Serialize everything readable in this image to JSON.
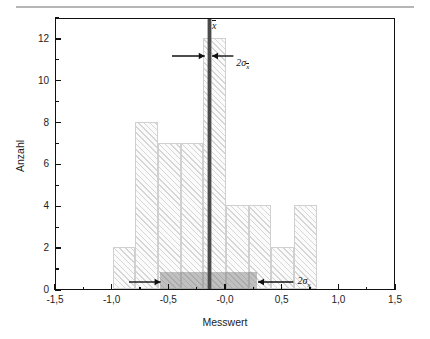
{
  "figure": {
    "top_rule": true,
    "background": "#ffffff",
    "frame_color": "#111111"
  },
  "chart_data": {
    "type": "bar",
    "title": "",
    "subtitle": "",
    "xlabel": "Messwert",
    "ylabel": "Anzahl",
    "xlim": [
      -1.5,
      1.5
    ],
    "ylim": [
      0,
      13
    ],
    "grid": false,
    "legend": null,
    "bar_color": "#fbfbfb",
    "bar_edge_color": "#d0d0d0",
    "hatch": "diagonal-45",
    "bin_width": 0.2,
    "bin_edges": [
      -1.0,
      -0.8,
      -0.6,
      -0.4,
      -0.2,
      0.0,
      0.2,
      0.4,
      0.6,
      0.8
    ],
    "categories": [
      "-1,0 bis -0,8",
      "-0,8 bis -0,6",
      "-0,6 bis -0,4",
      "-0,4 bis -0,2",
      "-0,2 bis -0,0",
      "-0,0 bis 0,2",
      "0,2 bis 0,4",
      "0,4 bis 0,6",
      "0,6 bis 0,8"
    ],
    "values": [
      2,
      8,
      7,
      7,
      12,
      4,
      4,
      2,
      4
    ],
    "xticks": [
      -1.5,
      -1.0,
      -0.5,
      -0.0,
      0.5,
      1.0,
      1.5
    ],
    "xticklabels": [
      "-1,5",
      "-1,0",
      "-0,5",
      "-0,0",
      "0,5",
      "1,0",
      "1,5"
    ],
    "xminor_ticks": [
      -1.25,
      -0.75,
      -0.25,
      0.25,
      0.75,
      1.25
    ],
    "yticks": [
      0,
      2,
      4,
      6,
      8,
      10,
      12
    ],
    "yticklabels": [
      "0",
      "2",
      "4",
      "6",
      "8",
      "10",
      "12"
    ],
    "yminor_ticks": [
      1,
      3,
      5,
      7,
      9,
      11,
      13
    ],
    "annotations": {
      "mean": {
        "label": "x",
        "overbar": true,
        "value": -0.15,
        "line_color": "#4a4a4a"
      },
      "sigma_mean": {
        "label_prefix": "2",
        "label_sigma": "σ",
        "label_sub": "x",
        "label_sub_overbar": true,
        "full_label": "2σx̄",
        "value_low": -0.19,
        "value_high": -0.11,
        "y_level": 11.2
      },
      "sigma_x": {
        "label_prefix": "2",
        "label_sigma": "σ",
        "label_sub": "x",
        "label_sub_overbar": false,
        "full_label": "2σx",
        "value_low": -0.58,
        "value_high": 0.27,
        "y_level": 0.8,
        "band_color": "rgba(120,120,120,0.45)"
      }
    }
  }
}
